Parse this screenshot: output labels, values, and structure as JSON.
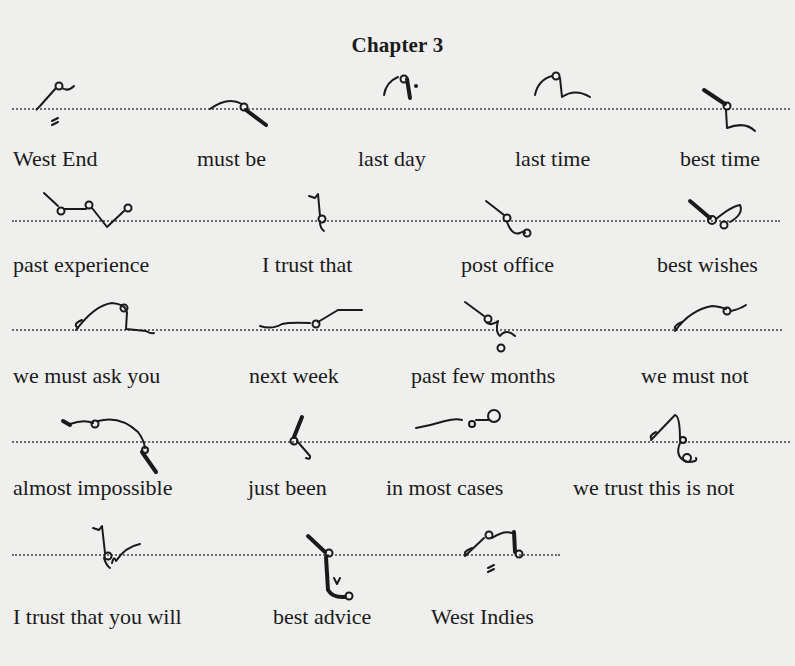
{
  "chapter_title": "Chapter 3",
  "rows": [
    {
      "items": [
        "West End",
        "must be",
        "last day",
        "last time",
        "best time"
      ]
    },
    {
      "items": [
        "past experience",
        "I trust that",
        "post office",
        "best wishes"
      ]
    },
    {
      "items": [
        "we must ask you",
        "next week",
        "past few months",
        "we must not"
      ]
    },
    {
      "items": [
        "almost impossible",
        "just been",
        "in most cases",
        "we trust this is not"
      ]
    },
    {
      "items": [
        "I trust that you will",
        "best advice",
        "West Indies"
      ]
    }
  ]
}
